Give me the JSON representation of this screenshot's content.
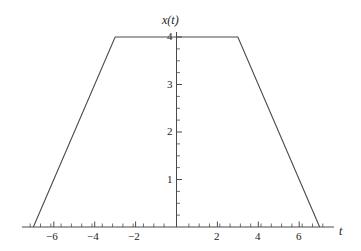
{
  "chart_data": {
    "type": "line",
    "title": "",
    "subtitle": "",
    "xlabel": "t",
    "ylabel": "x(t)",
    "xlim": [
      -7.6,
      7.6
    ],
    "ylim": [
      0,
      4.35
    ],
    "grid": false,
    "legend": null,
    "series": [
      {
        "name": "x(t)",
        "color": "#4a4a4a",
        "x": [
          -7,
          -3,
          3,
          7
        ],
        "y": [
          0,
          4,
          4,
          0
        ]
      }
    ],
    "annotations": [],
    "x_ticks_major": [
      -6,
      -4,
      -2,
      2,
      4,
      6
    ],
    "x_tick_labels": [
      "−6",
      "−4",
      "−2",
      "2",
      "4",
      "6"
    ],
    "x_minor_tick_step": 0.5,
    "y_ticks_major": [
      1,
      2,
      3,
      4
    ],
    "y_tick_labels": [
      "1",
      "2",
      "3",
      "4"
    ],
    "y_minor_tick_step": 0.25
  },
  "axes": {
    "y_axis_label": "x(t)",
    "x_axis_label": "t"
  },
  "x_labels": {
    "n6": "−6",
    "n4": "−4",
    "n2": "−2",
    "p2": "2",
    "p4": "4",
    "p6": "6"
  },
  "y_labels": {
    "one": "1",
    "two": "2",
    "three": "3",
    "four": "4"
  },
  "watermark": {
    "line1": "",
    "line2": ""
  },
  "colors": {
    "curve": "#4a4a4a",
    "axis": "#4a4a4a",
    "text": "#1a1a1a",
    "background": "#ffffff"
  }
}
